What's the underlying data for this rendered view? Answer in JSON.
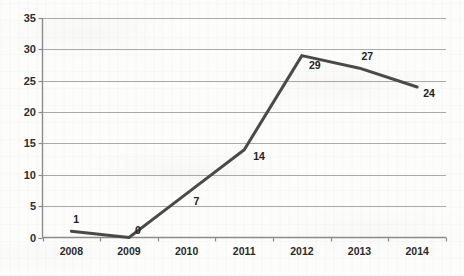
{
  "chart_data": {
    "type": "line",
    "title": "",
    "subtitle": "",
    "xlabel": "",
    "ylabel": "",
    "categories": [
      "2008",
      "2009",
      "2010",
      "2011",
      "2012",
      "2013",
      "2014"
    ],
    "values": [
      1,
      0,
      7,
      14,
      29,
      27,
      24
    ],
    "point_labels": [
      "1",
      "0",
      "7",
      "14",
      "29",
      "27",
      "24"
    ],
    "series": [
      {
        "name": "",
        "values": [
          1,
          0,
          7,
          14,
          29,
          27,
          24
        ],
        "color": "#4a4a4a"
      }
    ],
    "ylim": [
      0,
      35
    ],
    "ytick_step": 5,
    "ytick_labels": [
      "0",
      "5",
      "10",
      "15",
      "20",
      "25",
      "30",
      "35"
    ],
    "ytick_values": [
      0,
      5,
      10,
      15,
      20,
      25,
      30,
      35
    ],
    "grid": true,
    "grid_axis": "y",
    "legend": false,
    "legend_position": "none",
    "data_labels_shown": true,
    "colors": {
      "line": "#4a4a4a",
      "grid": "#a9a9a9",
      "axis": "#8c8c8c",
      "text": "#242424",
      "background": "#fdfdfc"
    }
  },
  "axes": {
    "y_axis_name": "value-axis",
    "x_axis_name": "year-axis"
  }
}
